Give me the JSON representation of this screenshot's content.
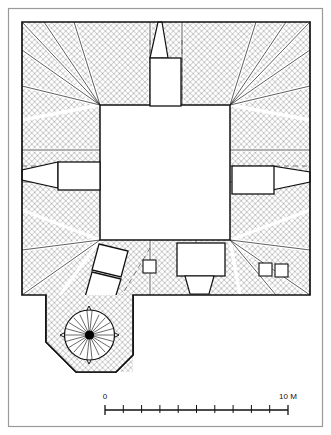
{
  "figure": {
    "kind": "architectural-site-plan",
    "colors": {
      "ink": "#111111",
      "paper": "#ffffff",
      "hatch": "#9a9a9a",
      "hatch_light": "#c9c9c9",
      "frame": "#8d8d8d",
      "dot": "#000000"
    }
  },
  "scale_bar": {
    "start_label": "0",
    "end_label": "10 M",
    "divisions": 10,
    "unit": "M",
    "total_length": 10
  },
  "features": {
    "courtyard": "central-open-court",
    "north_chamber": "north-axial-chamber",
    "west_chamber": "west-axial-chamber",
    "east_chamber": "east-axial-chamber",
    "south_chamber": "south-axial-chamber",
    "oblique_range": "oblique-двух-segment-range",
    "small_cells": "paired-small-cells",
    "bastion": "octagonal-domed-bastion",
    "bastion_centre": "central-pivot-point"
  }
}
